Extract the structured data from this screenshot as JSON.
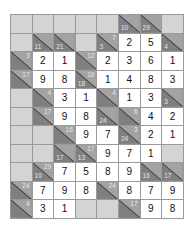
{
  "puzzle": {
    "type": "kakuro",
    "cols": 8,
    "rows": 11,
    "colors": {
      "empty": "#d4d4d4",
      "clue": "#8f8f8f",
      "value": "#ffffff",
      "grid_line": "#9a9a9a"
    },
    "grid": [
      [
        {
          "t": "e"
        },
        {
          "t": "e"
        },
        {
          "t": "e"
        },
        {
          "t": "e"
        },
        {
          "t": "e"
        },
        {
          "t": "c",
          "d": "10"
        },
        {
          "t": "c",
          "d": "29"
        },
        {
          "t": "e"
        }
      ],
      [
        {
          "t": "e"
        },
        {
          "t": "c",
          "d": "11"
        },
        {
          "t": "c",
          "d": "21"
        },
        {
          "t": "e"
        },
        {
          "t": "c",
          "r": "7",
          "d": "3"
        },
        {
          "t": "v",
          "v": "2"
        },
        {
          "t": "v",
          "v": "5"
        },
        {
          "t": "c",
          "d": "4"
        }
      ],
      [
        {
          "t": "c",
          "r": "3"
        },
        {
          "t": "v",
          "v": "2"
        },
        {
          "t": "v",
          "v": "1"
        },
        {
          "t": "c",
          "r": "12"
        },
        {
          "t": "v",
          "v": "2"
        },
        {
          "t": "v",
          "v": "3"
        },
        {
          "t": "v",
          "v": "6"
        },
        {
          "t": "v",
          "v": "1"
        }
      ],
      [
        {
          "t": "c",
          "r": "17"
        },
        {
          "t": "v",
          "v": "9"
        },
        {
          "t": "v",
          "v": "8"
        },
        {
          "t": "c",
          "r": "16",
          "d": "18"
        },
        {
          "t": "v",
          "v": "1"
        },
        {
          "t": "v",
          "v": "4"
        },
        {
          "t": "v",
          "v": "8"
        },
        {
          "t": "v",
          "v": "3"
        }
      ],
      [
        {
          "t": "e"
        },
        {
          "t": "c",
          "r": "4"
        },
        {
          "t": "v",
          "v": "3"
        },
        {
          "t": "v",
          "v": "1"
        },
        {
          "t": "c",
          "r": "4"
        },
        {
          "t": "v",
          "v": "1"
        },
        {
          "t": "v",
          "v": "3"
        },
        {
          "t": "c",
          "d": "3"
        }
      ],
      [
        {
          "t": "e"
        },
        {
          "t": "c",
          "r": "17"
        },
        {
          "t": "v",
          "v": "9"
        },
        {
          "t": "v",
          "v": "8"
        },
        {
          "t": "c",
          "d": "24"
        },
        {
          "t": "c",
          "r": "6"
        },
        {
          "t": "v",
          "v": "4"
        },
        {
          "t": "v",
          "v": "2"
        }
      ],
      [
        {
          "t": "e"
        },
        {
          "t": "e"
        },
        {
          "t": "c",
          "r": "16"
        },
        {
          "t": "v",
          "v": "9"
        },
        {
          "t": "v",
          "v": "7"
        },
        {
          "t": "c",
          "r": "3",
          "d": "24"
        },
        {
          "t": "v",
          "v": "2"
        },
        {
          "t": "v",
          "v": "1"
        }
      ],
      [
        {
          "t": "e"
        },
        {
          "t": "e"
        },
        {
          "t": "c",
          "d": "17"
        },
        {
          "t": "c",
          "r": "17",
          "d": "13"
        },
        {
          "t": "v",
          "v": "9"
        },
        {
          "t": "v",
          "v": "7"
        },
        {
          "t": "v",
          "v": "1"
        },
        {
          "t": "e"
        }
      ],
      [
        {
          "t": "e"
        },
        {
          "t": "c",
          "r": "29",
          "d": "10"
        },
        {
          "t": "v",
          "v": "7"
        },
        {
          "t": "v",
          "v": "5"
        },
        {
          "t": "v",
          "v": "8"
        },
        {
          "t": "v",
          "v": "9"
        },
        {
          "t": "c",
          "d": "16"
        },
        {
          "t": "c",
          "d": "17"
        }
      ],
      [
        {
          "t": "c",
          "r": "24"
        },
        {
          "t": "v",
          "v": "7"
        },
        {
          "t": "v",
          "v": "9"
        },
        {
          "t": "v",
          "v": "8"
        },
        {
          "t": "c",
          "r": "24"
        },
        {
          "t": "v",
          "v": "8"
        },
        {
          "t": "v",
          "v": "7"
        },
        {
          "t": "v",
          "v": "9"
        }
      ],
      [
        {
          "t": "c",
          "r": "4"
        },
        {
          "t": "v",
          "v": "3"
        },
        {
          "t": "v",
          "v": "1"
        },
        {
          "t": "e"
        },
        {
          "t": "e"
        },
        {
          "t": "c",
          "r": "17"
        },
        {
          "t": "v",
          "v": "9"
        },
        {
          "t": "v",
          "v": "8"
        }
      ]
    ]
  }
}
